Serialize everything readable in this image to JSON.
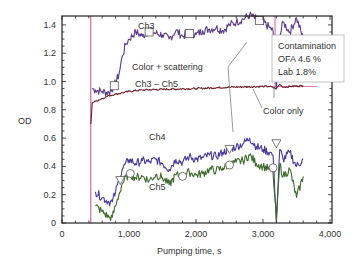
{
  "chart_data": {
    "type": "line",
    "title": "",
    "xlabel": "Pumping time, s",
    "ylabel": "OD",
    "xlim": [
      0,
      4000
    ],
    "ylim": [
      0,
      1.5
    ],
    "x_ticks": [
      0,
      1000,
      2000,
      3000,
      4000
    ],
    "x_tick_labels": [
      "0",
      "1,000",
      "2,000",
      "3,000",
      "4,000"
    ],
    "y_ticks": [
      0,
      0.2,
      0.4,
      0.6,
      0.8,
      1.0,
      1.2,
      1.4
    ],
    "y_tick_labels": [
      "0",
      "0.2",
      "0.4",
      "0.6",
      "0.8",
      "1.0",
      "1.2",
      "1.4"
    ],
    "grid": false,
    "series": [
      {
        "name": "Ch3",
        "color": "#5a3a8c",
        "x": [
          450,
          500,
          600,
          700,
          780,
          850,
          900,
          950,
          1000,
          1100,
          1200,
          1300,
          1400,
          1500,
          1600,
          1700,
          1800,
          1900,
          2000,
          2100,
          2200,
          2300,
          2400,
          2500,
          2600,
          2700,
          2800,
          2900,
          3000,
          3100,
          3150,
          3200,
          3250,
          3300,
          3400,
          3500,
          3600
        ],
        "values": [
          0.95,
          0.94,
          0.93,
          0.92,
          0.97,
          1.05,
          1.18,
          1.26,
          1.3,
          1.35,
          1.32,
          1.36,
          1.34,
          1.33,
          1.3,
          1.36,
          1.32,
          1.35,
          1.33,
          1.36,
          1.37,
          1.38,
          1.36,
          1.4,
          1.42,
          1.44,
          1.47,
          1.44,
          1.42,
          1.38,
          1.36,
          0.95,
          1.32,
          1.42,
          1.35,
          1.45,
          1.3
        ]
      },
      {
        "name": "Ch3 – Ch5",
        "color": "#6b1f2a",
        "x": [
          430,
          450,
          500,
          600,
          700,
          800,
          900,
          1000,
          1200,
          1500,
          2000,
          2500,
          3000,
          3100,
          3200,
          3250,
          3300,
          3400,
          3600
        ],
        "values": [
          0.7,
          0.85,
          0.86,
          0.88,
          0.9,
          0.91,
          0.92,
          0.93,
          0.94,
          0.945,
          0.95,
          0.96,
          0.965,
          0.965,
          0.95,
          0.98,
          0.96,
          0.965,
          0.97
        ]
      },
      {
        "name": "Ch4",
        "color": "#4a3a9c",
        "x": [
          500,
          600,
          700,
          750,
          800,
          850,
          900,
          1000,
          1100,
          1200,
          1300,
          1400,
          1500,
          1600,
          1700,
          1800,
          1900,
          2000,
          2100,
          2200,
          2300,
          2400,
          2500,
          2600,
          2700,
          2800,
          2900,
          3000,
          3100,
          3150,
          3200,
          3250,
          3300,
          3400,
          3500,
          3600
        ],
        "values": [
          0.22,
          0.18,
          0.15,
          0.15,
          0.22,
          0.3,
          0.38,
          0.45,
          0.42,
          0.44,
          0.43,
          0.45,
          0.42,
          0.38,
          0.45,
          0.43,
          0.47,
          0.45,
          0.46,
          0.48,
          0.47,
          0.5,
          0.52,
          0.54,
          0.56,
          0.6,
          0.54,
          0.52,
          0.5,
          0.48,
          0.02,
          0.52,
          0.45,
          0.5,
          0.4,
          0.45
        ]
      },
      {
        "name": "Ch5",
        "color": "#3c6a2a",
        "x": [
          500,
          600,
          700,
          750,
          800,
          850,
          900,
          1000,
          1100,
          1200,
          1300,
          1400,
          1500,
          1600,
          1700,
          1800,
          1900,
          2000,
          2100,
          2200,
          2300,
          2400,
          2500,
          2600,
          2700,
          2800,
          2900,
          3000,
          3100,
          3150,
          3200,
          3250,
          3300,
          3400,
          3500,
          3600
        ],
        "values": [
          0.12,
          0.08,
          0.04,
          0.04,
          0.12,
          0.2,
          0.28,
          0.35,
          0.32,
          0.33,
          0.3,
          0.34,
          0.32,
          0.27,
          0.34,
          0.33,
          0.36,
          0.34,
          0.35,
          0.38,
          0.37,
          0.39,
          0.41,
          0.43,
          0.44,
          0.48,
          0.42,
          0.4,
          0.38,
          0.36,
          0.01,
          0.42,
          0.33,
          0.38,
          0.18,
          0.33
        ]
      }
    ],
    "vertical_line": {
      "x": 430,
      "color": "#c0397a"
    },
    "horizontal_reference": {
      "y": 0.965,
      "from_x": 3150,
      "to_x": 3800,
      "color": "#c0397a"
    },
    "annotations": [
      {
        "text": "Ch3",
        "x": 1150,
        "y": 1.38
      },
      {
        "text": "Color + scattering",
        "x": 1100,
        "y": 1.1
      },
      {
        "text": "Ch3 – Ch5",
        "x": 1130,
        "y": 1.0
      },
      {
        "text": "Color only",
        "x": 3150,
        "y": 0.78
      },
      {
        "text": "Ch4",
        "x": 1300,
        "y": 0.5
      },
      {
        "text": "Ch5",
        "x": 1300,
        "y": 0.22
      }
    ],
    "legend_box": {
      "lines": [
        "Contamination",
        "OFA 4.6 %",
        "Lab 1.8%"
      ]
    },
    "markers": [
      {
        "series": "Ch3",
        "shape": "square",
        "x": 780,
        "y": 0.97
      },
      {
        "series": "Ch3",
        "shape": "square",
        "x": 1300,
        "y": 1.35
      },
      {
        "series": "Ch3",
        "shape": "square",
        "x": 1900,
        "y": 1.34
      },
      {
        "series": "Ch3",
        "shape": "square",
        "x": 2950,
        "y": 1.43
      },
      {
        "series": "Ch4",
        "shape": "triangle-down",
        "x": 870,
        "y": 0.3
      },
      {
        "series": "Ch4",
        "shape": "triangle-down",
        "x": 2500,
        "y": 0.52
      },
      {
        "series": "Ch4",
        "shape": "triangle-down",
        "x": 3200,
        "y": 0.56
      },
      {
        "series": "Ch5",
        "shape": "circle",
        "x": 1020,
        "y": 0.35
      },
      {
        "series": "Ch5",
        "shape": "circle",
        "x": 1800,
        "y": 0.33
      },
      {
        "series": "Ch5",
        "shape": "circle",
        "x": 2500,
        "y": 0.41
      },
      {
        "series": "Ch5",
        "shape": "circle",
        "x": 3150,
        "y": 0.39
      }
    ]
  },
  "labels": {
    "ylabel": "OD",
    "xlabel": "Pumping time, s",
    "ch3": "Ch3",
    "color_scattering": "Color + scattering",
    "ch3_ch5": "Ch3 – Ch5",
    "color_only": "Color only",
    "ch4": "Ch4",
    "ch5": "Ch5",
    "legend_line1": "Contamination",
    "legend_line2": "OFA 4.6 %",
    "legend_line3": "Lab 1.8%"
  }
}
